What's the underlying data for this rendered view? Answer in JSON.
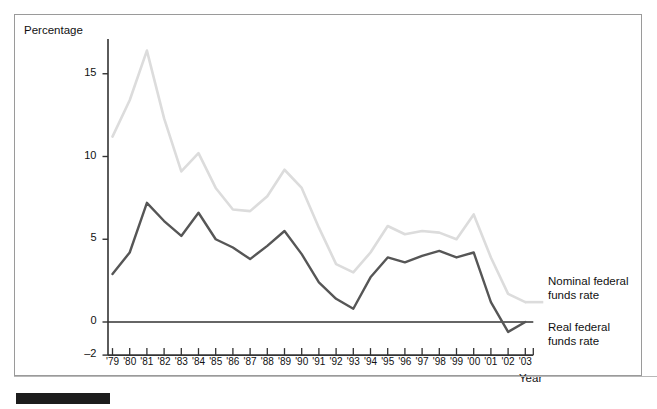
{
  "figure": {
    "background": "#ffffff",
    "frame_color": "#9a9a9a"
  },
  "axes": {
    "y_title": "Percentage",
    "x_title": "Year",
    "y_ticks": [
      {
        "label": "15",
        "value": 15
      },
      {
        "label": "10",
        "value": 10
      },
      {
        "label": "5",
        "value": 5
      },
      {
        "label": "0",
        "value": 0
      },
      {
        "label": "-2",
        "value": -2
      }
    ],
    "x_tick_labels": [
      "'79",
      "'80",
      "'81",
      "'82",
      "'83",
      "'84",
      "'85",
      "'86",
      "'87",
      "'88",
      "'89",
      "'90",
      "'91",
      "'92",
      "'93",
      "'94",
      "'95",
      "'96",
      "'97",
      "'98",
      "'99",
      "'00",
      "'01",
      "'02",
      "'03"
    ]
  },
  "legend": {
    "nominal_line1": "Nominal federal",
    "nominal_line2": "funds rate",
    "real_line1": "Real federal",
    "real_line2": "funds rate"
  },
  "colors": {
    "nominal": "#dcdcdc",
    "real": "#565656",
    "zero_axis": "#333333",
    "axis": "#333333"
  },
  "chart_data": {
    "type": "line",
    "title": "",
    "xlabel": "Year",
    "ylabel": "Percentage",
    "xlim": [
      1979,
      2003
    ],
    "ylim": [
      -2,
      17
    ],
    "grid": false,
    "legend_position": "right-inline",
    "x": [
      1979,
      1980,
      1981,
      1982,
      1983,
      1984,
      1985,
      1986,
      1987,
      1988,
      1989,
      1990,
      1991,
      1992,
      1993,
      1994,
      1995,
      1996,
      1997,
      1998,
      1999,
      2000,
      2001,
      2002,
      2003
    ],
    "categories": [
      "'79",
      "'80",
      "'81",
      "'82",
      "'83",
      "'84",
      "'85",
      "'86",
      "'87",
      "'88",
      "'89",
      "'90",
      "'91",
      "'92",
      "'93",
      "'94",
      "'95",
      "'96",
      "'97",
      "'98",
      "'99",
      "'00",
      "'01",
      "'02",
      "'03"
    ],
    "series": [
      {
        "name": "Nominal federal funds rate",
        "color": "#dcdcdc",
        "values": [
          11.2,
          13.4,
          16.4,
          12.3,
          9.1,
          10.2,
          8.1,
          6.8,
          6.7,
          7.6,
          9.2,
          8.1,
          5.7,
          3.5,
          3.0,
          4.2,
          5.8,
          5.3,
          5.5,
          5.4,
          5.0,
          6.5,
          3.9,
          1.7,
          1.2
        ]
      },
      {
        "name": "Real federal funds rate",
        "color": "#565656",
        "values": [
          2.9,
          4.2,
          7.2,
          6.1,
          5.2,
          6.6,
          5.0,
          4.5,
          3.8,
          4.6,
          5.5,
          4.1,
          2.4,
          1.4,
          0.8,
          2.7,
          3.9,
          3.6,
          4.0,
          4.3,
          3.9,
          4.2,
          1.2,
          -0.6,
          0.0
        ]
      }
    ]
  }
}
